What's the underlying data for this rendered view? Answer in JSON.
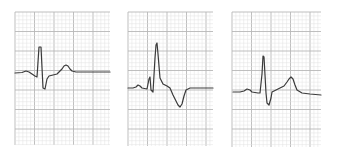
{
  "figure": {
    "colors": {
      "background": "#ffffff",
      "grid_minor": "#e2e2e2",
      "grid_major": "#b8b8b8",
      "trace": "#3a3a3a"
    },
    "grid": {
      "minor_px": 3.9,
      "major_every": 5
    },
    "panels": [
      {
        "name": "ecg-panel-1",
        "x": 15,
        "y": 12,
        "width": 95,
        "height": 133,
        "trace": "M15,73 L22,72.5 L26,71 L29,72 L32,74 L35,76 L37,77 L39,47 L41,47 L43,88 L45,89 L47,79 L49,76 L53,75 L57,74 L60,71 L62,69 L64,66 L66,65 L68,66 L70,69 L72,71 L76,72 L85,72 L100,72 L110,72"
      },
      {
        "name": "ecg-panel-2",
        "x": 128,
        "y": 12,
        "width": 85,
        "height": 134,
        "trace": "M128,88 L133,88 L136,87 L138,85 L140,86 L142,88 L147,89 L149,79 L150,77 L151,90 L153,92 L155,58 L156,45 L157,43 L158,54 L160,78 L163,84 L167,86 L170,88 L173,95 L176,101 L178,105 L180,107 L182,104 L184,96 L186,90 L190,88 L200,88 L213,88"
      },
      {
        "name": "ecg-panel-3",
        "x": 232,
        "y": 12,
        "width": 89,
        "height": 135,
        "trace": "M233,92 L240,92 L244,91 L247,89 L250,90 L252,92 L258,93 L260,93 L262,74 L263,56 L264,57 L266,93 L267,103 L269,105 L271,98 L272,92 L276,90 L280,88 L284,86 L287,82 L289,79 L291,77 L293,79 L295,85 L297,90 L302,93 L310,94 L321,95"
      }
    ]
  }
}
